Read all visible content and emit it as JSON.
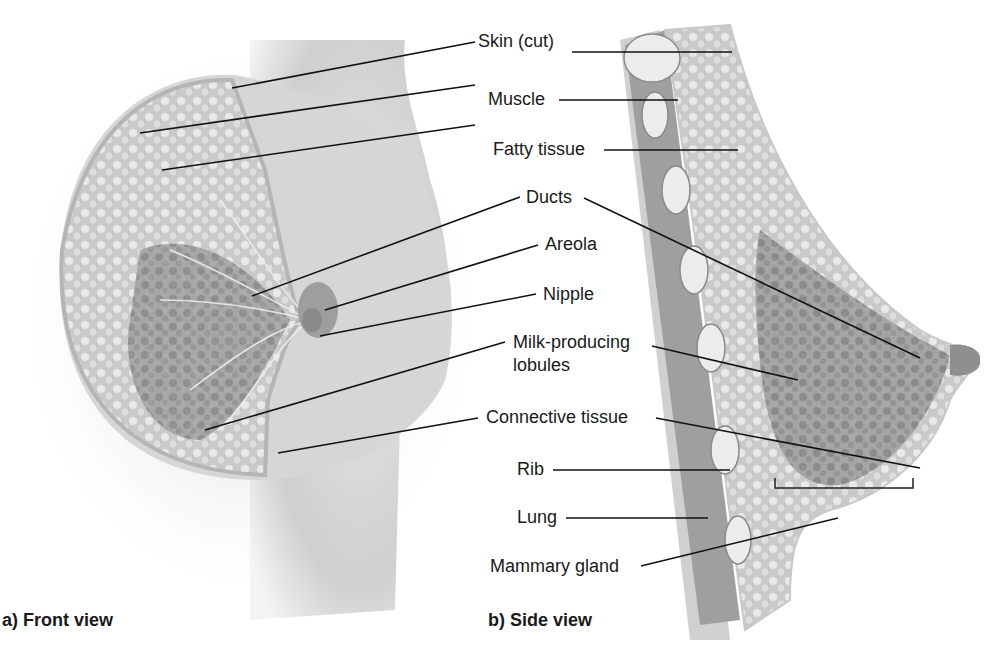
{
  "diagram": {
    "type": "anatomical-illustration",
    "panels": [
      {
        "id": "a",
        "caption": "a) Front view"
      },
      {
        "id": "b",
        "caption": "b) Side view"
      }
    ],
    "labels": {
      "skin": "Skin (cut)",
      "muscle": "Muscle",
      "fatty": "Fatty tissue",
      "ducts": "Ducts",
      "areola": "Areola",
      "nipple": "Nipple",
      "lobules_1": "Milk-producing",
      "lobules_2": "lobules",
      "connective": "Connective tissue",
      "rib": "Rib",
      "lung": "Lung",
      "mammary": "Mammary gland"
    },
    "colors": {
      "body_tone": "#d9d9d9",
      "tissue_fill": "#bfbfbf",
      "lobule_fill": "#8f8f8f",
      "muscle_fill": "#9a9a9a",
      "rib_fill": "#ececec",
      "leader_line": "#111111",
      "text": "#1a1a1a"
    }
  }
}
